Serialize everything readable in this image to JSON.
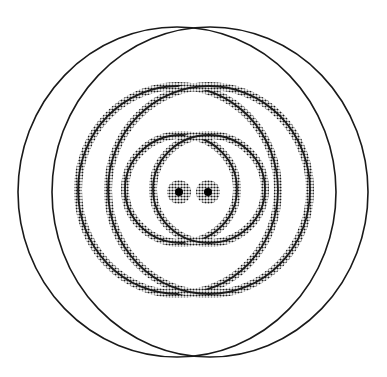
{
  "diagram": {
    "background": "#ffffff",
    "ink_color": "#1a1a1a",
    "sources": [
      {
        "id": "source-left",
        "cx": 179,
        "cy": 192,
        "r": 12
      },
      {
        "id": "source-right",
        "cx": 208,
        "cy": 192,
        "r": 12
      }
    ],
    "rings": [
      {
        "id": "inner-left",
        "cx": 181,
        "cy": 189,
        "rx": 56,
        "ry": 54,
        "style": "halftone"
      },
      {
        "id": "inner-right",
        "cx": 209,
        "cy": 189,
        "rx": 56,
        "ry": 54,
        "style": "halftone"
      },
      {
        "id": "middle-left",
        "cx": 178,
        "cy": 190,
        "rx": 100,
        "ry": 104,
        "style": "halftone"
      },
      {
        "id": "middle-right",
        "cx": 209,
        "cy": 190,
        "rx": 101,
        "ry": 104,
        "style": "halftone"
      },
      {
        "id": "outer-left",
        "cx": 177,
        "cy": 192,
        "rx": 159,
        "ry": 165,
        "style": "solid"
      },
      {
        "id": "outer-right",
        "cx": 210,
        "cy": 192,
        "rx": 158,
        "ry": 165,
        "style": "solid"
      }
    ]
  }
}
